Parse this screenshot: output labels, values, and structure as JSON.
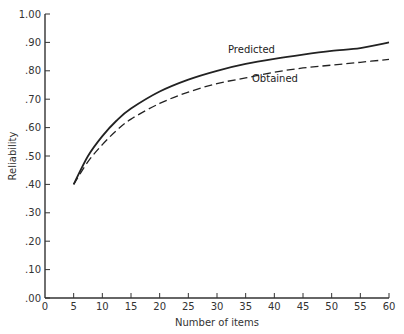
{
  "chart_data": {
    "type": "line",
    "title": "",
    "xlabel": "Number of items",
    "ylabel": "Reliability",
    "xlim": [
      0,
      60
    ],
    "ylim": [
      0,
      1.0
    ],
    "x_ticks": [
      0,
      5,
      10,
      15,
      20,
      25,
      30,
      35,
      40,
      45,
      50,
      55,
      60
    ],
    "x_tick_labels": [
      "0",
      "5",
      "10",
      "15",
      "20",
      "25",
      "30",
      "35",
      "40",
      "45",
      "50",
      "55",
      "60"
    ],
    "y_ticks": [
      0,
      0.1,
      0.2,
      0.3,
      0.4,
      0.5,
      0.6,
      0.7,
      0.8,
      0.9,
      1.0
    ],
    "y_tick_labels": [
      ".00",
      ".10",
      ".20",
      ".30",
      ".40",
      ".50",
      ".60",
      ".70",
      ".80",
      ".90",
      "1.00"
    ],
    "grid": false,
    "legend": "inline labels near curves",
    "x": [
      5,
      7.5,
      10,
      12.5,
      15,
      20,
      25,
      30,
      35,
      40,
      45,
      50,
      55,
      60
    ],
    "series": [
      {
        "name": "Predicted",
        "style": "solid",
        "values": [
          0.4,
          0.5,
          0.57,
          0.625,
          0.667,
          0.727,
          0.769,
          0.8,
          0.824,
          0.842,
          0.857,
          0.87,
          0.88,
          0.9
        ]
      },
      {
        "name": "Obtained",
        "style": "dashed",
        "values": [
          0.4,
          0.48,
          0.54,
          0.59,
          0.63,
          0.685,
          0.725,
          0.755,
          0.775,
          0.795,
          0.81,
          0.82,
          0.83,
          0.84
        ]
      }
    ],
    "annotations": [
      {
        "text": "Predicted",
        "x": 32,
        "y": 0.84
      },
      {
        "text": "Obtained",
        "x": 40,
        "y": 0.77
      }
    ]
  }
}
